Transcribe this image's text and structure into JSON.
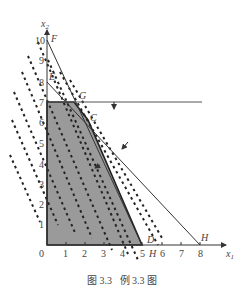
{
  "diagram": {
    "axes": {
      "x_label": "x",
      "x_sub": "1",
      "y_label": "x",
      "y_sub": "2",
      "x_ticks": [
        "0",
        "1",
        "2",
        "3",
        "4",
        "5",
        "6",
        "7",
        "8"
      ],
      "y_ticks": [
        "1",
        "2",
        "3",
        "4",
        "5",
        "6",
        "7",
        "8",
        "9",
        "10"
      ]
    },
    "points": {
      "F": "F",
      "E": "E",
      "G": "G",
      "C": "C",
      "D": "D",
      "H_top": "H",
      "H_axis": "H"
    },
    "feasible_region_color": "#9a9a9a",
    "line_color": "#333333"
  },
  "caption": {
    "figure": "图 3.3",
    "title": "例 3.3 图"
  }
}
